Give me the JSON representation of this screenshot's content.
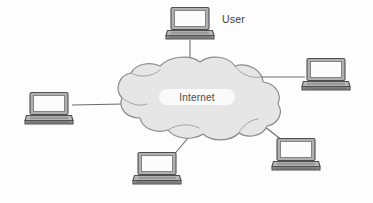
{
  "diagram": {
    "background_color": "#fdfdfd",
    "cloud": {
      "label": "Internet",
      "fill_color": "#e6e6e6",
      "stroke_color": "#8a8a8a",
      "label_highlight_color": "#fafafa",
      "center_x": 196,
      "center_y": 100
    },
    "line_color": "#6b6b6b",
    "laptop": {
      "screen_fill": "#fbfbfb",
      "bezel_fill": "#a8a8a8",
      "body_fill": "#b4b4b4",
      "base_fill": "#8f8f8f",
      "outline": "#4f4f4f"
    },
    "nodes": [
      {
        "id": "laptop-top",
        "name": "laptop-top",
        "label": "User",
        "label_visible": true,
        "x": 166,
        "y": 7,
        "width": 48,
        "height": 34,
        "connects_to": "internet-cloud"
      },
      {
        "id": "laptop-right-top",
        "name": "laptop-right-top",
        "label": "",
        "label_visible": false,
        "x": 302,
        "y": 58,
        "width": 48,
        "height": 34,
        "connects_to": "internet-cloud"
      },
      {
        "id": "laptop-left",
        "name": "laptop-left",
        "label": "",
        "label_visible": false,
        "x": 25,
        "y": 92,
        "width": 48,
        "height": 34,
        "connects_to": "internet-cloud"
      },
      {
        "id": "laptop-right-bottom",
        "name": "laptop-right-bottom",
        "label": "",
        "label_visible": false,
        "x": 272,
        "y": 138,
        "width": 48,
        "height": 34,
        "connects_to": "internet-cloud"
      },
      {
        "id": "laptop-bottom",
        "name": "laptop-bottom",
        "label": "",
        "label_visible": false,
        "x": 133,
        "y": 152,
        "width": 48,
        "height": 34,
        "connects_to": "internet-cloud"
      }
    ],
    "links": [
      {
        "id": "link-top",
        "from": "laptop-top",
        "to": "internet-cloud",
        "x1": 190,
        "y1": 41,
        "x2": 190,
        "y2": 68
      },
      {
        "id": "link-right-top",
        "from": "laptop-right-top",
        "to": "internet-cloud",
        "x1": 302,
        "y1": 77,
        "x2": 263,
        "y2": 77
      },
      {
        "id": "link-left",
        "from": "laptop-left",
        "to": "internet-cloud",
        "x1": 73,
        "y1": 105,
        "x2": 121,
        "y2": 104
      },
      {
        "id": "link-right-bottom",
        "from": "laptop-right-bottom",
        "to": "internet-cloud",
        "x1": 280,
        "y1": 140,
        "x2": 256,
        "y2": 120
      },
      {
        "id": "link-bottom",
        "from": "laptop-bottom",
        "to": "internet-cloud",
        "x1": 175,
        "y1": 155,
        "x2": 193,
        "y2": 133
      }
    ],
    "artifact_text": "scan bleed-through"
  }
}
